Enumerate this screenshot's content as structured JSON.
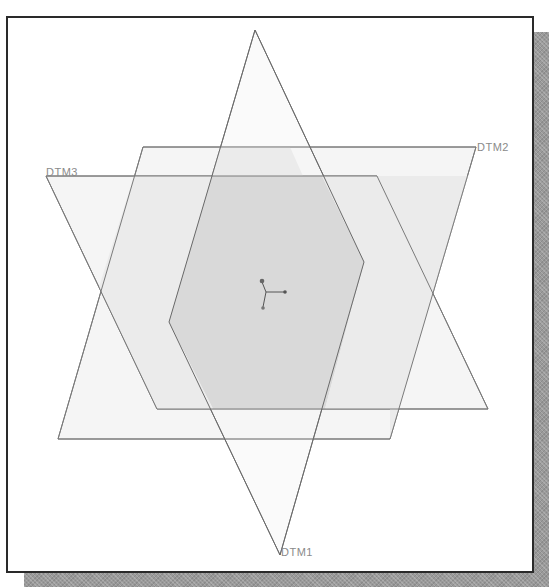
{
  "scene": {
    "colors": {
      "frame_border": "#2a2a2a",
      "shadow": "#9a9a9a",
      "background": "#ffffff",
      "plane_edge": "#6e6e6e",
      "single_fill": "#f4f4f4",
      "double_fill": "#e6e6e6",
      "triple_fill": "#d6d6d6",
      "label": "#8a8a8a",
      "csys": "#555555"
    },
    "planes": [
      {
        "name": "DTM1",
        "label": "DTM1",
        "orientation": "vertical rhombus"
      },
      {
        "name": "DTM2",
        "label": "DTM2",
        "orientation": "parallelogram leaning right"
      },
      {
        "name": "DTM3",
        "label": "DTM3",
        "orientation": "parallelogram leaning left"
      }
    ],
    "csys_icon": "coordinate-system-icon"
  }
}
